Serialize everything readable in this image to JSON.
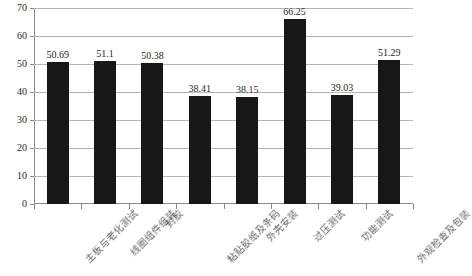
{
  "chart_data": {
    "type": "bar",
    "title": "",
    "xlabel": "",
    "ylabel": "",
    "ylim": [
      0,
      70
    ],
    "ytick_step": 10,
    "yticks": [
      0,
      10,
      20,
      30,
      40,
      50,
      60,
      70
    ],
    "grid": true,
    "legend": "none",
    "bar_color": "#171717",
    "gridline_color": "#b4b4b4",
    "axis_color": "#8a8a8a",
    "categories": [
      "主板与老化测试",
      "线圈组件组装",
      "封胶",
      "粘贴胶纸及条码",
      "外壳安装",
      "过压测试",
      "功能测试",
      "外观检查及包装"
    ],
    "values": [
      50.69,
      51.1,
      50.38,
      38.41,
      38.15,
      66.25,
      39.03,
      51.29
    ],
    "value_labels": [
      "50.69",
      "51.1",
      "50.38",
      "38.41",
      "38.15",
      "66.25",
      "39.03",
      "51.29"
    ]
  }
}
